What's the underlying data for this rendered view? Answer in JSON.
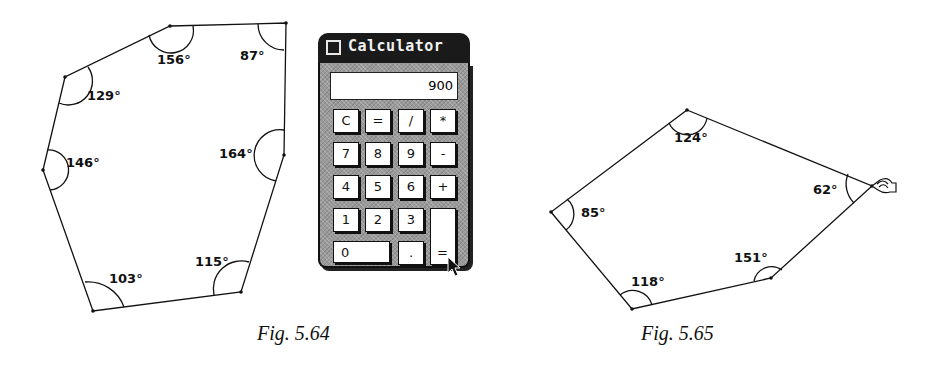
{
  "figures": [
    {
      "caption": "Fig. 5.64",
      "angles": [
        "156°",
        "87°",
        "129°",
        "164°",
        "146°",
        "115°",
        "103°"
      ]
    },
    {
      "caption": "Fig. 5.65",
      "angles": [
        "124°",
        "62°",
        "85°",
        "151°",
        "118°"
      ]
    }
  ],
  "calculator": {
    "title": "Calculator",
    "display": "900",
    "keys": {
      "clear": "C",
      "equals_top": "=",
      "divide": "/",
      "multiply": "*",
      "seven": "7",
      "eight": "8",
      "nine": "9",
      "minus": "-",
      "four": "4",
      "five": "5",
      "six": "6",
      "plus": "+",
      "one": "1",
      "two": "2",
      "three": "3",
      "zero": "0",
      "decimal": ".",
      "equals": "="
    }
  }
}
